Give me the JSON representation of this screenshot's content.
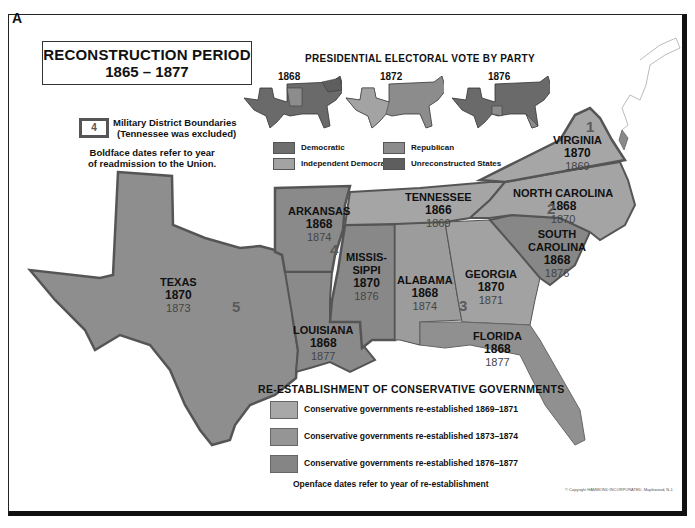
{
  "corner_letter": "A",
  "title": {
    "line1": "RECONSTRUCTION PERIOD",
    "line2": "1865 – 1877"
  },
  "military_legend": {
    "box_number": "4",
    "line1": "Military District Boundaries",
    "line2": "(Tennessee was excluded)",
    "note_line1": "Boldface dates refer to year",
    "note_line2": "of readmission to the Union."
  },
  "presidential_vote": {
    "title": "PRESIDENTIAL ELECTORAL VOTE BY PARTY",
    "years": [
      "1868",
      "1872",
      "1876"
    ],
    "legend": [
      {
        "label": "Democratic",
        "color": "#6e6e6e"
      },
      {
        "label": "Republican",
        "color": "#8c8c8c"
      },
      {
        "label": "Independent Democratic",
        "color": "#a3a3a3"
      },
      {
        "label": "Unreconstructed States",
        "color": "#5e5e5e"
      }
    ]
  },
  "states": [
    {
      "name": "TEXAS",
      "readmitted": "1870",
      "reestablished": "1873"
    },
    {
      "name": "ARKANSAS",
      "readmitted": "1868",
      "reestablished": "1874"
    },
    {
      "name": "LOUISIANA",
      "readmitted": "1868",
      "reestablished": "1877"
    },
    {
      "name": "MISSIS-",
      "name2": "SIPPI",
      "readmitted": "1870",
      "reestablished": "1876"
    },
    {
      "name": "ALABAMA",
      "readmitted": "1868",
      "reestablished": "1874"
    },
    {
      "name": "GEORGIA",
      "readmitted": "1870",
      "reestablished": "1871"
    },
    {
      "name": "FLORIDA",
      "readmitted": "1868",
      "reestablished": "1877"
    },
    {
      "name": "SOUTH",
      "name2": "CAROLINA",
      "readmitted": "1868",
      "reestablished": "1876"
    },
    {
      "name": "NORTH CAROLINA",
      "readmitted": "1868",
      "reestablished": "1870"
    },
    {
      "name": "VIRGINIA",
      "readmitted": "1870",
      "reestablished": "1869"
    },
    {
      "name": "TENNESSEE",
      "readmitted": "1866",
      "reestablished": "1869"
    }
  ],
  "districts": [
    "1",
    "2",
    "3",
    "4",
    "5"
  ],
  "reestablishment": {
    "title": "RE-ESTABLISHMENT OF CONSERVATIVE GOVERNMENTS",
    "items": [
      {
        "label": "Conservative governments re-established 1869–1871",
        "color": "#a8a8a8"
      },
      {
        "label": "Conservative governments re-established 1873–1874",
        "color": "#959595"
      },
      {
        "label": "Conservative governments re-established 1876–1877",
        "color": "#858585"
      }
    ],
    "note": "Openface dates refer to year of re-establishment"
  },
  "copyright": "© Copyright HAMMOND INCORPORATED, Maplewood, N.J."
}
